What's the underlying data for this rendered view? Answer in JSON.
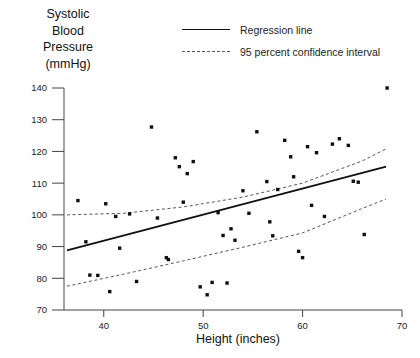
{
  "chart_data": {
    "type": "scatter",
    "title": "",
    "ylabel": "Systolic\nBlood\nPressure\n(mmHg)",
    "xlabel": "Height (inches)",
    "xlim": [
      36,
      70
    ],
    "ylim": [
      70,
      140
    ],
    "xticks": [
      40,
      50,
      60,
      70
    ],
    "yticks": [
      70,
      80,
      90,
      100,
      110,
      120,
      130,
      140
    ],
    "xtick_labels": [
      "40",
      "50",
      "60",
      "70"
    ],
    "ytick_labels": [
      "70",
      "80",
      "90",
      "100",
      "110",
      "120",
      "130",
      "140"
    ],
    "grid": false,
    "legend_position": "top-center",
    "legend": [
      {
        "label": "Regression line",
        "style": "solid",
        "color": "#111111"
      },
      {
        "label": "95 percent confidence interval",
        "style": "dashed",
        "color": "#555555"
      }
    ],
    "marker": {
      "shape": "square",
      "color": "#111111",
      "size": 3.4
    },
    "points": [
      {
        "x": 37.4,
        "y": 104.5
      },
      {
        "x": 38.2,
        "y": 91.5
      },
      {
        "x": 38.6,
        "y": 81.0
      },
      {
        "x": 39.4,
        "y": 80.9
      },
      {
        "x": 40.2,
        "y": 103.5
      },
      {
        "x": 40.6,
        "y": 75.8
      },
      {
        "x": 41.2,
        "y": 99.5
      },
      {
        "x": 41.6,
        "y": 89.5
      },
      {
        "x": 42.6,
        "y": 100.3
      },
      {
        "x": 43.3,
        "y": 79.0
      },
      {
        "x": 44.8,
        "y": 127.7
      },
      {
        "x": 45.4,
        "y": 99.0
      },
      {
        "x": 46.3,
        "y": 86.5
      },
      {
        "x": 46.5,
        "y": 85.9
      },
      {
        "x": 47.2,
        "y": 118.0
      },
      {
        "x": 47.6,
        "y": 115.2
      },
      {
        "x": 48.0,
        "y": 104.0
      },
      {
        "x": 48.4,
        "y": 113.0
      },
      {
        "x": 49.0,
        "y": 116.8
      },
      {
        "x": 49.7,
        "y": 77.3
      },
      {
        "x": 50.4,
        "y": 74.8
      },
      {
        "x": 50.9,
        "y": 78.7
      },
      {
        "x": 51.5,
        "y": 100.7
      },
      {
        "x": 52.0,
        "y": 93.5
      },
      {
        "x": 52.4,
        "y": 78.5
      },
      {
        "x": 52.8,
        "y": 95.6
      },
      {
        "x": 53.2,
        "y": 92.0
      },
      {
        "x": 54.0,
        "y": 107.6
      },
      {
        "x": 54.6,
        "y": 100.5
      },
      {
        "x": 55.4,
        "y": 126.2
      },
      {
        "x": 56.4,
        "y": 110.5
      },
      {
        "x": 56.7,
        "y": 97.8
      },
      {
        "x": 57.0,
        "y": 93.4
      },
      {
        "x": 57.5,
        "y": 108.0
      },
      {
        "x": 58.2,
        "y": 123.5
      },
      {
        "x": 58.8,
        "y": 118.3
      },
      {
        "x": 59.1,
        "y": 112.0
      },
      {
        "x": 59.6,
        "y": 88.5
      },
      {
        "x": 60.0,
        "y": 86.5
      },
      {
        "x": 60.5,
        "y": 121.5
      },
      {
        "x": 60.9,
        "y": 103.0
      },
      {
        "x": 61.4,
        "y": 119.6
      },
      {
        "x": 62.2,
        "y": 99.5
      },
      {
        "x": 63.0,
        "y": 122.3
      },
      {
        "x": 63.7,
        "y": 124.0
      },
      {
        "x": 64.6,
        "y": 121.9
      },
      {
        "x": 65.1,
        "y": 110.6
      },
      {
        "x": 65.6,
        "y": 110.3
      },
      {
        "x": 66.2,
        "y": 93.8
      },
      {
        "x": 68.5,
        "y": 140.0
      }
    ],
    "regression_line": {
      "name": "Regression line",
      "x": [
        36.3,
        68.4
      ],
      "y": [
        88.8,
        115.2
      ],
      "slope": 0.82,
      "intercept": 59.0
    },
    "confidence_interval": {
      "name": "95 percent confidence interval",
      "level": 95,
      "upper": {
        "x": [
          36.3,
          42,
          48,
          54,
          60,
          66,
          68.4
        ],
        "y": [
          100.0,
          100.5,
          102.5,
          105.6,
          110.0,
          117.0,
          120.8
        ]
      },
      "lower": {
        "x": [
          36.3,
          42,
          48,
          54,
          60,
          66,
          68.4
        ],
        "y": [
          77.5,
          81.3,
          85.5,
          89.8,
          94.3,
          102.0,
          105.0
        ]
      }
    }
  }
}
